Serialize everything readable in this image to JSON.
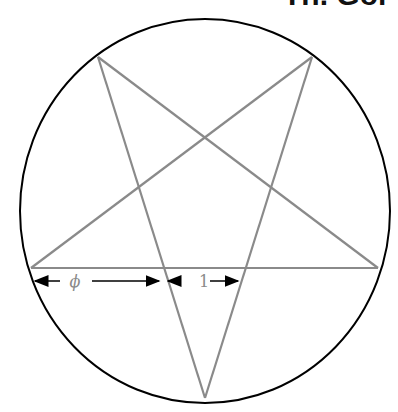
{
  "title_fragment": "Th. Gol",
  "diagram": {
    "type": "pentagram-in-circle",
    "circle": {
      "cx": 205,
      "cy": 211,
      "rx": 185,
      "ry": 192,
      "stroke": "#000000"
    },
    "star": {
      "stroke": "#8a8a8a",
      "vertices": [
        [
          98,
          57
        ],
        [
          312,
          57
        ],
        [
          378,
          268
        ],
        [
          205,
          398
        ],
        [
          31,
          268
        ]
      ]
    },
    "labels": {
      "phi": "ϕ",
      "one": "1"
    },
    "label_color": "#8a8a8a"
  }
}
